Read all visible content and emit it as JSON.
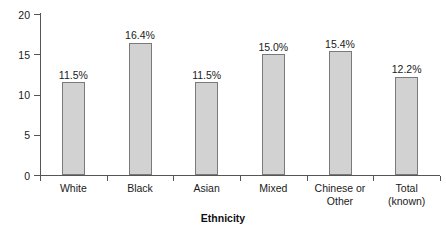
{
  "chart_data": {
    "type": "bar",
    "title": "",
    "subtitle": "",
    "xlabel": "Ethnicity",
    "ylabel": "",
    "categories": [
      "White",
      "Black",
      "Asian",
      "Mixed",
      "Chinese or\nOther",
      "Total\n(known)"
    ],
    "values": [
      11.5,
      16.4,
      11.5,
      15.0,
      15.4,
      12.2
    ],
    "data_labels": [
      "11.5%",
      "16.4%",
      "11.5%",
      "15.0%",
      "15.4%",
      "12.2%"
    ],
    "ylim": [
      0,
      20
    ],
    "yticks": [
      0,
      5,
      10,
      15,
      20
    ],
    "ytick_labels": [
      "0",
      "5",
      "10",
      "15",
      "20"
    ],
    "grid": false,
    "legend": false,
    "bar_fill_color": "#d2d2d2",
    "bar_edge_color": "#7a7a7a",
    "axis_color": "#555555",
    "background_color": "#ffffff"
  }
}
